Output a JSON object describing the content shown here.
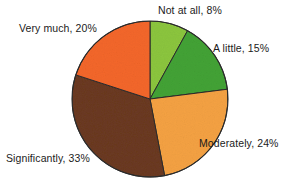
{
  "chart_data": {
    "type": "pie",
    "title": "",
    "subtitle": "",
    "xlabel": "",
    "ylabel": "",
    "legend_position": "none",
    "grid": false,
    "labels_on_slices": false,
    "labels_outside": true,
    "start_angle_deg": 0,
    "direction": "clockwise",
    "categories": [
      "Not at all",
      "A little",
      "Moderately",
      "Significantly",
      "Very much"
    ],
    "values": [
      8,
      15,
      24,
      33,
      20
    ],
    "value_unit": "%",
    "colors": [
      "#8CC63F",
      "#43A335",
      "#F5A243",
      "#6B3A20",
      "#F4672A"
    ],
    "slices": [
      {
        "name": "Not at all",
        "value": 8,
        "label": "Not at all, 8%",
        "color": "#8CC63F",
        "start_deg": 0,
        "end_deg": 28.8
      },
      {
        "name": "A little",
        "value": 15,
        "label": "A little, 15%",
        "color": "#43A335",
        "start_deg": 28.8,
        "end_deg": 82.8
      },
      {
        "name": "Moderately",
        "value": 24,
        "label": "Moderately, 24%",
        "color": "#F5A243",
        "start_deg": 82.8,
        "end_deg": 169.2
      },
      {
        "name": "Significantly",
        "value": 33,
        "label": "Significantly, 33%",
        "color": "#6B3A20",
        "start_deg": 169.2,
        "end_deg": 288.0
      },
      {
        "name": "Very much",
        "value": 20,
        "label": "Very much, 20%",
        "color": "#F4672A",
        "start_deg": 288.0,
        "end_deg": 360.0
      }
    ]
  },
  "chart": {
    "center_x": 150,
    "center_y": 99,
    "radius": 78,
    "outline_color": "#2b2b2b",
    "background": "#ffffff",
    "label_color": "#1b1b1b"
  },
  "labels": {
    "not_at_all": "Not at all, 8%",
    "a_little": "A little, 15%",
    "moderately": "Moderately, 24%",
    "significantly": "Significantly, 33%",
    "very_much": "Very much, 20%"
  }
}
